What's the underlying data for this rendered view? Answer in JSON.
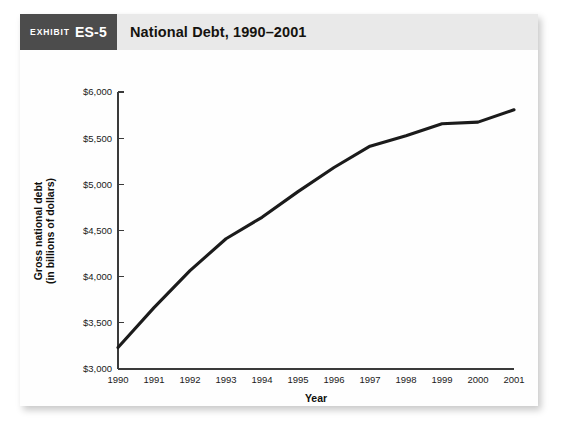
{
  "exhibit": {
    "badge_word": "Exhibit",
    "badge_number": "ES-5",
    "title": "National Debt, 1990–2001"
  },
  "colors": {
    "badge_background": "#4c4c4c",
    "header_background": "#e9e9e9",
    "line": "#1b1b1b",
    "axis": "#3a3a3a",
    "card_background": "#ffffff"
  },
  "chart_data": {
    "type": "line",
    "title": "National Debt, 1990–2001",
    "xlabel": "Year",
    "ylabel": "Gross national debt (in billions of dollars)",
    "ylabel_line1": "Gross national debt",
    "ylabel_line2": "(in billions of dollars)",
    "categories": [
      "1990",
      "1991",
      "1992",
      "1993",
      "1994",
      "1995",
      "1996",
      "1997",
      "1998",
      "1999",
      "2000",
      "2001"
    ],
    "x": [
      1990,
      1991,
      1992,
      1993,
      1994,
      1995,
      1996,
      1997,
      1998,
      1999,
      2000,
      2001
    ],
    "values": [
      3233,
      3665,
      4065,
      4411,
      4643,
      4921,
      5182,
      5413,
      5526,
      5656,
      5674,
      5807
    ],
    "series": [
      {
        "name": "Gross national debt",
        "values": [
          3233,
          3665,
          4065,
          4411,
          4643,
          4921,
          5182,
          5413,
          5526,
          5656,
          5674,
          5807
        ]
      }
    ],
    "ylim": [
      3000,
      6000
    ],
    "xlim": [
      1990,
      2001
    ],
    "ytick_values": [
      3000,
      3500,
      4000,
      4500,
      5000,
      5500,
      6000
    ],
    "ytick_labels": [
      "$3,000",
      "$3,500",
      "$4,000",
      "$4,500",
      "$5,000",
      "$5,500",
      "$6,000"
    ],
    "xtick_labels": [
      "1990",
      "1991",
      "1992",
      "1993",
      "1994",
      "1995",
      "1996",
      "1997",
      "1998",
      "1999",
      "2000",
      "2001"
    ],
    "grid": false,
    "legend": false,
    "legend_position": "none"
  }
}
